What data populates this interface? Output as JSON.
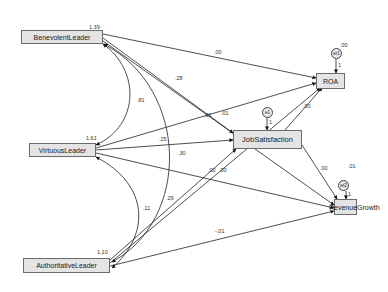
{
  "diagram": {
    "type": "path-model",
    "exogenous": [
      {
        "id": "benevolent",
        "label": "BenevolentLeader",
        "variance": "1.39"
      },
      {
        "id": "virtuous",
        "label": "VirtuousLeader",
        "variance": "1.61"
      },
      {
        "id": "authoritative",
        "label": "AuthoritativeLeader",
        "variance": "1.10"
      }
    ],
    "endogenous": [
      {
        "id": "job",
        "label": "JobSatisfaction",
        "error": "e1",
        "error_weight": "1"
      },
      {
        "id": "roa",
        "label": "ROA",
        "error": "er1",
        "error_variance": ".00",
        "error_weight": "1"
      },
      {
        "id": "rev",
        "label": "RevenueGrowth",
        "error": "er2",
        "error_variance": ".01",
        "error_weight": "1"
      }
    ],
    "covariances": [
      {
        "from": "BenevolentLeader",
        "to": "VirtuousLeader",
        "value": ".81"
      },
      {
        "from": "BenevolentLeader",
        "to": "AuthoritativeLeader",
        "value": ".30"
      },
      {
        "from": "VirtuousLeader",
        "to": "AuthoritativeLeader",
        "value": ".11"
      }
    ],
    "paths": [
      {
        "from": "BenevolentLeader",
        "to": "ROA",
        "value": ".00"
      },
      {
        "from": "BenevolentLeader",
        "to": "JobSatisfaction",
        "value": ".28"
      },
      {
        "from": "BenevolentLeader",
        "to": "RevenueGrowth",
        "value": ".01"
      },
      {
        "from": "VirtuousLeader",
        "to": "ROA",
        "value": ".01"
      },
      {
        "from": "VirtuousLeader",
        "to": "JobSatisfaction",
        "value": ".25"
      },
      {
        "from": "VirtuousLeader",
        "to": "RevenueGrowth",
        "value": ".00"
      },
      {
        "from": "AuthoritativeLeader",
        "to": "JobSatisfaction",
        "value": ".29"
      },
      {
        "from": "AuthoritativeLeader",
        "to": "ROA",
        "value": ".00"
      },
      {
        "from": "AuthoritativeLeader",
        "to": "RevenueGrowth",
        "value": "-.01"
      },
      {
        "from": "JobSatisfaction",
        "to": "ROA",
        "value": ".00"
      },
      {
        "from": "JobSatisfaction",
        "to": "RevenueGrowth",
        "value": ".00"
      }
    ],
    "edge_labels": {
      "b_roa": ".00",
      "b_job": ".28",
      "cov_bv": ".81",
      "v_roa": ".01",
      "b_rev": ".01",
      "v_job": ".25",
      "cov_ba": ".30",
      "v_rev_a": ".00",
      "a_roa": ".00",
      "cov_va": ".11",
      "a_job": ".29",
      "a_rev": "-.01",
      "job_roa": ".00",
      "job_rev": ".00"
    }
  }
}
